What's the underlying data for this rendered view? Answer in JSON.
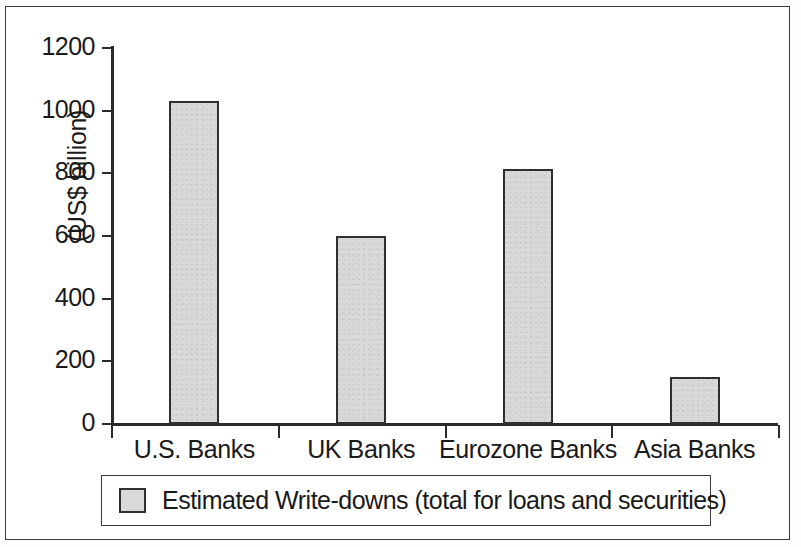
{
  "chart_data": {
    "type": "bar",
    "title": "",
    "subtitle": "",
    "xlabel": "",
    "ylabel": "(US$ billion)",
    "categories": [
      "U.S. Banks",
      "UK Banks",
      "Eurozone Banks",
      "Asia Banks"
    ],
    "values": [
      1030,
      600,
      815,
      150
    ],
    "series": [
      {
        "name": "Estimated Write-downs (total for loans and securities)",
        "values": [
          1030,
          600,
          815,
          150
        ]
      }
    ],
    "ylim": [
      0,
      1200
    ],
    "yticks": [
      0,
      200,
      400,
      600,
      800,
      1000,
      1200
    ],
    "ytick_labels": [
      "0",
      "200",
      "400",
      "600",
      "800",
      "1000",
      "1200"
    ],
    "grid": false,
    "legend_position": "bottom",
    "bar_fill_color": "#d9d9d9",
    "bar_edge_color": "#2f2f2f",
    "axis_color": "#2b2b2b",
    "text_color": "#1a1a1a"
  },
  "legend": {
    "entries": [
      {
        "label": "Estimated Write-downs (total for loans and securities)",
        "swatch_color": "#d9d9d9"
      }
    ]
  }
}
